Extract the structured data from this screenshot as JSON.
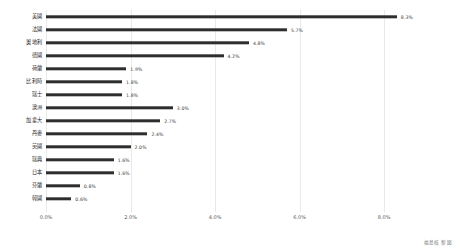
{
  "chart_data": {
    "type": "bar",
    "orientation": "horizontal",
    "title": "",
    "subtitle": "",
    "xlabel": "",
    "ylabel": "",
    "xlim": [
      0,
      8.8
    ],
    "xticks": [
      "0.0%",
      "2.0%",
      "4.0%",
      "6.0%",
      "8.0%"
    ],
    "xtick_values": [
      0,
      2,
      4,
      6,
      8
    ],
    "grid": true,
    "legend": null,
    "bar_color": "#2e2e2e",
    "background": "#ffffff",
    "gridline_color": "#e9e9e9",
    "categories": [
      "美國",
      "法國",
      "奧地利",
      "德國",
      "荷蘭",
      "比利時",
      "瑞士",
      "澳洲",
      "加拿大",
      "丹麥",
      "英國",
      "瑞典",
      "日本",
      "芬蘭",
      "韓國"
    ],
    "values": [
      8.3,
      5.7,
      4.8,
      4.2,
      1.9,
      1.8,
      1.8,
      3.0,
      2.7,
      2.4,
      2.0,
      1.6,
      1.6,
      0.8,
      0.6
    ],
    "value_labels": [
      "8.3%",
      "5.7%",
      "4.8%",
      "4.2%",
      "1.9%",
      "1.8%",
      "1.8%",
      "3.0%",
      "2.7%",
      "2.4%",
      "2.0%",
      "1.6%",
      "1.6%",
      "0.8%",
      "0.6%"
    ]
  },
  "caption": "福島核 製図"
}
